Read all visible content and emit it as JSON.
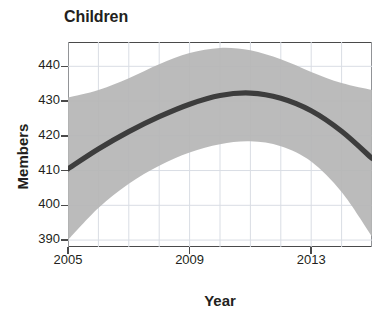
{
  "chart_data": {
    "type": "line",
    "title": "Children",
    "xlabel": "Year",
    "ylabel": "Members",
    "grid": true,
    "legend": false,
    "xlim": [
      2005,
      2015
    ],
    "ylim": [
      388,
      447
    ],
    "xticks": [
      2005,
      2009,
      2013
    ],
    "xticklabels": [
      "2005",
      "2009",
      "2013"
    ],
    "yticks": [
      390,
      400,
      410,
      420,
      430,
      440
    ],
    "yticklabels": [
      "390",
      "400",
      "410",
      "420",
      "430",
      "440"
    ],
    "series": [
      {
        "name": "Fitted trend",
        "style": "thick-dark-line",
        "color": "#3d3d3d",
        "x": [
          2005,
          2006,
          2007,
          2008,
          2009,
          2010,
          2011,
          2012,
          2013,
          2014,
          2015
        ],
        "values": [
          410.5,
          416.2,
          421.2,
          425.5,
          429.1,
          431.6,
          432.3,
          430.8,
          427.2,
          421.3,
          413.5
        ]
      }
    ],
    "confidence_band": {
      "name": "Confidence interval",
      "color": "#b5b5b5",
      "x": [
        2005,
        2006,
        2007,
        2008,
        2009,
        2010,
        2011,
        2012,
        2013,
        2014,
        2015
      ],
      "upper": [
        431.0,
        433.2,
        436.6,
        440.6,
        443.8,
        445.3,
        444.6,
        442.0,
        438.4,
        435.2,
        433.2
      ],
      "lower": [
        390.0,
        399.2,
        406.2,
        411.4,
        415.2,
        417.6,
        418.4,
        417.0,
        412.6,
        403.8,
        391.0
      ]
    }
  },
  "colors": {
    "line": "#3d3d3d",
    "band": "#b5b5b5",
    "grid": "#d9dde4",
    "frame": "#4a4a4a",
    "text": "#231f20",
    "background": "#ffffff"
  }
}
